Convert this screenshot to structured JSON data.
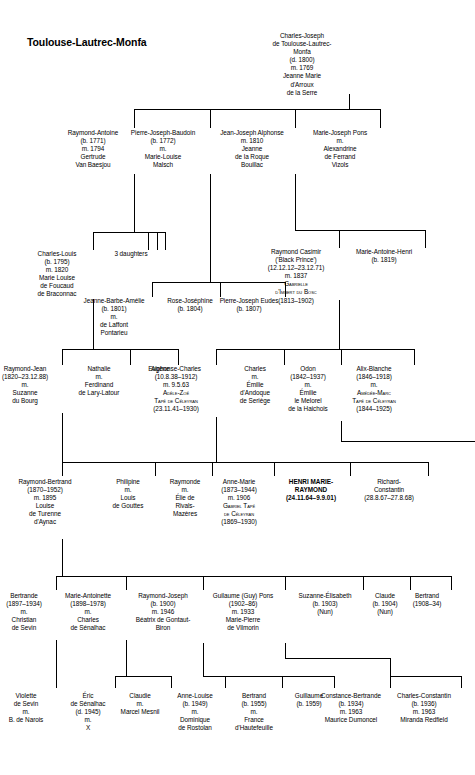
{
  "title": "Toulouse-Lautrec-Monfa",
  "chart_data": {
    "type": "diagram",
    "diagram_kind": "genealogy-family-tree",
    "generations": 7
  },
  "people": [
    {
      "id": "charles-joseph",
      "name": "Charles-Joseph",
      "x": 302,
      "y": 32,
      "w": 94,
      "gen": 1,
      "lines": [
        "Charles-Joseph",
        "de Toulouse-Lautrec-",
        "Monfa",
        "(d. 1800)",
        "m. 1769",
        "Jeanne Marie",
        "d'Arroux",
        "de la Serre"
      ]
    },
    {
      "id": "raymond-antoine",
      "name": "Raymond-Antoine",
      "x": 93,
      "y": 129,
      "w": 82,
      "gen": 2,
      "lines": [
        "Raymond-Antoine",
        "(b. 1771)",
        "m. 1794",
        "Gertrude",
        "Van Baesjou"
      ]
    },
    {
      "id": "pierre-joseph-baudoin",
      "name": "Pierre-Joseph-Baudoin",
      "x": 163,
      "y": 129,
      "w": 94,
      "gen": 2,
      "lines": [
        "Pierre-Joseph-Baudoin",
        "(b. 1772)",
        "m.",
        "Marie-Louise",
        "Malsch"
      ]
    },
    {
      "id": "jean-joseph-alphonse",
      "name": "Jean-Joseph Alphonse",
      "x": 252,
      "y": 129,
      "w": 86,
      "gen": 2,
      "lines": [
        "Jean-Joseph Alphonse",
        "m. 1810",
        "Jeanne",
        "de la Roque",
        "Bouillac"
      ]
    },
    {
      "id": "marie-joseph-pons",
      "name": "Marie-Joseph Pons",
      "x": 340,
      "y": 129,
      "w": 80,
      "gen": 2,
      "lines": [
        "Marie-Joseph Pons",
        "m.",
        "Alexandrine",
        "de Ferrand",
        "Vizols"
      ]
    },
    {
      "id": "charles-louis",
      "name": "Charles-Louis",
      "x": 57,
      "y": 250,
      "w": 72,
      "gen": 3,
      "lines": [
        "Charles-Louis",
        "(b. 1795)",
        "m. 1820",
        "Marie Louise",
        "de Foucaud",
        "de Braconnac"
      ]
    },
    {
      "id": "three-daughters",
      "name": "3 daughters",
      "x": 131,
      "y": 250,
      "w": 52,
      "gen": 3,
      "lines": [
        "3 daughters"
      ]
    },
    {
      "id": "raymond-casimir",
      "name": "Raymond Casimir",
      "x": 296,
      "y": 248,
      "w": 86,
      "gen": 3,
      "lines": [
        "Raymond Casimir",
        "('Black Prince')",
        "(12.12.12–23.12.71)",
        "m. 1837",
        "{sc}Gabrielle",
        "{sc}d'Imbert du Bosc",
        "(1813–1902)"
      ]
    },
    {
      "id": "marie-antoine-henri",
      "name": "Marie-Antoine-Henri",
      "x": 384,
      "y": 248,
      "w": 82,
      "gen": 3,
      "lines": [
        "Marie-Antoine-Henri",
        "(b. 1819)"
      ]
    },
    {
      "id": "jeanne-barbe-amelie",
      "name": "Jeanne-Barbe-Amelie",
      "x": 114,
      "y": 297,
      "w": 76,
      "gen": 3.5,
      "lines": [
        "Jeanne-Barbe-Amélie",
        "(b. 1801)",
        "m.",
        "de Laffont",
        "Pontarieu"
      ]
    },
    {
      "id": "rose-josephine",
      "name": "Rose-Josephine",
      "x": 190,
      "y": 297,
      "w": 60,
      "gen": 3.5,
      "lines": [
        "Rose-Joséphine",
        "(b. 1804)"
      ]
    },
    {
      "id": "pierre-joseph-eudes",
      "name": "Pierre-Joseph Eudes",
      "x": 249,
      "y": 297,
      "w": 72,
      "gen": 3.5,
      "lines": [
        "Pierre-Joseph Eudes",
        "(b. 1807)"
      ]
    },
    {
      "id": "raymond-jean",
      "name": "Raymond-Jean",
      "x": 25,
      "y": 365,
      "w": 74,
      "gen": 4,
      "lines": [
        "Raymond-Jean",
        "(1820–23.12.88)",
        "m.",
        "Suzanne",
        "du Bourg"
      ]
    },
    {
      "id": "nathalie",
      "name": "Nathalie",
      "x": 99,
      "y": 365,
      "w": 62,
      "gen": 4,
      "lines": [
        "Nathalie",
        "m.",
        "Ferdinand",
        "de Lary-Latour"
      ]
    },
    {
      "id": "eugene",
      "name": "Eugene",
      "x": 159,
      "y": 365,
      "w": 38,
      "gen": 4,
      "lines": [
        "Eugène"
      ]
    },
    {
      "id": "alphonse-charles",
      "name": "Alphonse-Charles",
      "x": 176,
      "y": 365,
      "w": 80,
      "gen": 4,
      "lines": [
        "Alphonse-Charles",
        "(10.8.38–1912)",
        "m. 9.5.63",
        "{sc}Adèle-Zoé",
        "{sc}Tapé de Céleyran",
        "(23.11.41–1930)"
      ]
    },
    {
      "id": "charles",
      "name": "Charles",
      "x": 255,
      "y": 365,
      "w": 58,
      "gen": 4,
      "lines": [
        "Charles",
        "m.",
        "Émilie",
        "d'Andoque",
        "de Seriège"
      ]
    },
    {
      "id": "odon",
      "name": "Odon",
      "x": 308,
      "y": 365,
      "w": 66,
      "gen": 4,
      "lines": [
        "Odon",
        "(1842–1937)",
        "m.",
        "Émilie",
        "le Melorel",
        "de la Haichois"
      ]
    },
    {
      "id": "alix-blanche",
      "name": "Alix-Blanche",
      "x": 374,
      "y": 365,
      "w": 80,
      "gen": 4,
      "lines": [
        "Alix-Blanche",
        "(1846–1918)",
        "m.",
        "{sc}Amédée-Marc",
        "{sc}Tapé de Céleyran",
        "(1844–1925)"
      ]
    },
    {
      "id": "raymond-bertrand",
      "name": "Raymond-Bertrand",
      "x": 45,
      "y": 478,
      "w": 84,
      "gen": 5,
      "lines": [
        "Raymond-Bertrand",
        "(1870–1952)",
        "m. 1895",
        "Louise",
        "de Turenne",
        "d'Aynac"
      ]
    },
    {
      "id": "philipine",
      "name": "Philipine",
      "x": 128,
      "y": 478,
      "w": 56,
      "gen": 5,
      "lines": [
        "Philipine",
        "m.",
        "Louis",
        "de Gouttes"
      ]
    },
    {
      "id": "raymonde",
      "name": "Raymonde",
      "x": 185,
      "y": 478,
      "w": 54,
      "gen": 5,
      "lines": [
        "Raymonde",
        "m.",
        "Élie de",
        "Rivals-",
        "Mazères"
      ]
    },
    {
      "id": "anne-marie",
      "name": "Anne-Marie",
      "x": 239,
      "y": 478,
      "w": 72,
      "gen": 5,
      "lines": [
        "Anne-Marie",
        "(1873–1944)",
        "m. 1906",
        "{sc}Gabriel Tapé",
        "{sc}de Céleyran",
        "(1869–1930)"
      ]
    },
    {
      "id": "henri-marie-raymond",
      "name": "HENRI MARIE-RAYMOND",
      "x": 311,
      "y": 478,
      "w": 78,
      "gen": 5,
      "highlight": true,
      "lines": [
        "HENRI MARIE-",
        "RAYMOND",
        "(24.11.64–9.9.01)"
      ]
    },
    {
      "id": "richard-constantin",
      "name": "Richard-Constantin",
      "x": 389,
      "y": 478,
      "w": 76,
      "gen": 5,
      "lines": [
        "Richard-",
        "Constantin",
        "(28.8.67–27.8.68)"
      ]
    },
    {
      "id": "bertrande",
      "name": "Bertrande",
      "x": 24,
      "y": 592,
      "w": 64,
      "gen": 6,
      "lines": [
        "Bertrande",
        "(1897–1934)",
        "m.",
        "Christian",
        "de Sevin"
      ]
    },
    {
      "id": "marie-antoinette",
      "name": "Marie-Antoinette",
      "x": 88,
      "y": 592,
      "w": 76,
      "gen": 6,
      "lines": [
        "Marie-Antoinette",
        "(1898–1978)",
        "m.",
        "Charles",
        "de Sénalhac"
      ]
    },
    {
      "id": "raymond-joseph",
      "name": "Raymond-Joseph",
      "x": 163,
      "y": 592,
      "w": 80,
      "gen": 6,
      "lines": [
        "Raymond-Joseph",
        "(b. 1900)",
        "m. 1946",
        "Béatrix de Gontaut-",
        "Biron"
      ]
    },
    {
      "id": "guilaume-guy-pons",
      "name": "Guilaume (Guy) Pons",
      "x": 243,
      "y": 592,
      "w": 84,
      "gen": 6,
      "lines": [
        "Guilaume (Guy) Pons",
        "(1902–86)",
        "m. 1933",
        "Marie-Pierre",
        "de Vilmorin"
      ]
    },
    {
      "id": "suzanne-elisabeth",
      "name": "Suzanne-Elisabeth",
      "x": 325,
      "y": 592,
      "w": 76,
      "gen": 6,
      "lines": [
        "Suzanne-Élisabeth",
        "(b. 1903)",
        "(Nun)"
      ]
    },
    {
      "id": "claude",
      "name": "Claude",
      "x": 385,
      "y": 592,
      "w": 50,
      "gen": 6,
      "lines": [
        "Claude",
        "(b. 1904)",
        "(Nun)"
      ]
    },
    {
      "id": "bertrand-1908",
      "name": "Bertrand",
      "x": 427,
      "y": 592,
      "w": 48,
      "gen": 6,
      "lines": [
        "Bertrand",
        "(1908–34)"
      ]
    },
    {
      "id": "violette-de-sevin",
      "name": "Violette de Sevin",
      "x": 26,
      "y": 692,
      "w": 62,
      "gen": 7,
      "lines": [
        "Violette",
        "de Sevin",
        "m.",
        "B. de Narois"
      ]
    },
    {
      "id": "eric-de-senalhac",
      "name": "Eric de Senalhac",
      "x": 88,
      "y": 692,
      "w": 56,
      "gen": 7,
      "lines": [
        "Éric",
        "de Sénalhac",
        "(d. 1945)",
        "m.",
        "X"
      ]
    },
    {
      "id": "claudie",
      "name": "Claudie",
      "x": 140,
      "y": 692,
      "w": 62,
      "gen": 7,
      "lines": [
        "Claudie",
        "m.",
        "Marcel Mesnil"
      ]
    },
    {
      "id": "anne-louise",
      "name": "Anne-Louise",
      "x": 195,
      "y": 692,
      "w": 62,
      "gen": 7,
      "lines": [
        "Anne-Louise",
        "(b. 1949)",
        "m.",
        "Dominique",
        "de Rostolan"
      ]
    },
    {
      "id": "bertrand-1955",
      "name": "Bertrand",
      "x": 254,
      "y": 692,
      "w": 58,
      "gen": 7,
      "lines": [
        "Bertrand",
        "(b. 1955)",
        "m.",
        "France",
        "d'Hautefeuille"
      ]
    },
    {
      "id": "guillaume-1959",
      "name": "Guillaume",
      "x": 309,
      "y": 692,
      "w": 48,
      "gen": 7,
      "lines": [
        "Guillaume",
        "(b. 1959)"
      ]
    },
    {
      "id": "constance-bertrande",
      "name": "Constance-Bertrande",
      "x": 351,
      "y": 692,
      "w": 78,
      "gen": 7,
      "lines": [
        "Constance-Bertrande",
        "(b. 1934)",
        "m. 1963",
        "Maurice Dumoncel"
      ]
    },
    {
      "id": "charles-constantin",
      "name": "Charles-Constantin",
      "x": 424,
      "y": 692,
      "w": 74,
      "gen": 7,
      "lines": [
        "Charles-Constantin",
        "(b. 1936)",
        "m. 1963",
        "Miranda Redfield"
      ]
    }
  ],
  "connectors": [
    {
      "name": "root-stem-down",
      "type": "v",
      "x": 349,
      "y": 94,
      "len": 15
    },
    {
      "name": "gen2-sibling-bar",
      "type": "h",
      "x": 134,
      "y": 109,
      "len": 246
    },
    {
      "name": "stem-raymond-antoine",
      "type": "v",
      "x": 134,
      "y": 109,
      "len": 19
    },
    {
      "name": "stem-pierre-joseph-baudoin",
      "type": "v",
      "x": 210,
      "y": 109,
      "len": 19
    },
    {
      "name": "stem-jean-joseph-alphonse",
      "type": "v",
      "x": 295,
      "y": 109,
      "len": 19
    },
    {
      "name": "stem-marie-joseph-pons",
      "type": "v",
      "x": 380,
      "y": 109,
      "len": 19
    },
    {
      "name": "drop-raymond-antoine",
      "type": "v",
      "x": 134,
      "y": 174,
      "len": 58
    },
    {
      "name": "gen3-left-bar",
      "type": "h",
      "x": 93,
      "y": 232,
      "len": 72
    },
    {
      "name": "stem-charles-louis",
      "type": "v",
      "x": 93,
      "y": 232,
      "len": 18
    },
    {
      "name": "stem-3daughters-a",
      "type": "v",
      "x": 148,
      "y": 232,
      "len": 18
    },
    {
      "name": "stem-3daughters-b",
      "type": "v",
      "x": 157,
      "y": 232,
      "len": 18
    },
    {
      "name": "stem-3daughters-c",
      "type": "v",
      "x": 165,
      "y": 232,
      "len": 18
    },
    {
      "name": "drop-pierre-joseph-baudoin",
      "type": "v",
      "x": 210,
      "y": 174,
      "len": 108
    },
    {
      "name": "gen3b-bar",
      "type": "h",
      "x": 152,
      "y": 282,
      "len": 133
    },
    {
      "name": "stem-jeanne-barbe",
      "type": "v",
      "x": 152,
      "y": 282,
      "len": 15
    },
    {
      "name": "stem-rose-josephine",
      "type": "v",
      "x": 220,
      "y": 282,
      "len": 15
    },
    {
      "name": "stem-pierre-joseph-eudes",
      "type": "v",
      "x": 285,
      "y": 282,
      "len": 15
    },
    {
      "name": "drop-jean-joseph-alphonse",
      "type": "v",
      "x": 295,
      "y": 174,
      "len": 56
    },
    {
      "name": "gen3-right-bar",
      "type": "h",
      "x": 339,
      "y": 230,
      "len": 86
    },
    {
      "name": "drop-to-gen3-right-bar",
      "type": "v",
      "x": 339,
      "y": 230,
      "len": 18
    },
    {
      "name": "stem-marie-antoine-henri",
      "type": "v",
      "x": 425,
      "y": 230,
      "len": 18
    },
    {
      "name": "link-jja-to-bar",
      "type": "h",
      "x": 295,
      "y": 230,
      "len": 45
    },
    {
      "name": "drop-charles-louis",
      "type": "v",
      "x": 93,
      "y": 299,
      "len": 50
    },
    {
      "name": "gen4-left-bar",
      "type": "h",
      "x": 62,
      "y": 349,
      "len": 116
    },
    {
      "name": "stem-raymond-jean",
      "type": "v",
      "x": 62,
      "y": 349,
      "len": 16
    },
    {
      "name": "stem-nathalie",
      "type": "v",
      "x": 130,
      "y": 349,
      "len": 16
    },
    {
      "name": "stem-eugene",
      "type": "v",
      "x": 178,
      "y": 349,
      "len": 16
    },
    {
      "name": "drop-raymond-casimir",
      "type": "v",
      "x": 339,
      "y": 300,
      "len": 49
    },
    {
      "name": "gen4-right-bar",
      "type": "h",
      "x": 216,
      "y": 349,
      "len": 198
    },
    {
      "name": "stem-alphonse-charles",
      "type": "v",
      "x": 216,
      "y": 349,
      "len": 16
    },
    {
      "name": "stem-charles",
      "type": "v",
      "x": 284,
      "y": 349,
      "len": 16
    },
    {
      "name": "stem-odon",
      "type": "v",
      "x": 341,
      "y": 349,
      "len": 16
    },
    {
      "name": "stem-alix-blanche",
      "type": "v",
      "x": 414,
      "y": 349,
      "len": 16
    },
    {
      "name": "drop-raymond-jean",
      "type": "v",
      "x": 62,
      "y": 413,
      "len": 49
    },
    {
      "name": "drop-alphonse-charles",
      "type": "v",
      "x": 216,
      "y": 417,
      "len": 45
    },
    {
      "name": "drop-odon",
      "type": "v",
      "x": 341,
      "y": 421,
      "len": 20
    },
    {
      "name": "odon-route-right",
      "type": "h",
      "x": 341,
      "y": 441,
      "len": 134
    },
    {
      "name": "gen5-left-bar",
      "type": "h",
      "x": 62,
      "y": 462,
      "len": 212
    },
    {
      "name": "ac-elbow-down",
      "type": "v",
      "x": 216,
      "y": 462,
      "len": 0
    },
    {
      "name": "gen5-left-to-right-join",
      "type": "h",
      "x": 216,
      "y": 462,
      "len": 134
    },
    {
      "name": "gen5-right-bar",
      "type": "h",
      "x": 350,
      "y": 462,
      "len": 78
    },
    {
      "name": "stem-raymond-bertrand",
      "type": "v",
      "x": 62,
      "y": 462,
      "len": 14
    },
    {
      "name": "stem-philipine",
      "type": "v",
      "x": 155,
      "y": 462,
      "len": 14
    },
    {
      "name": "stem-raymonde",
      "type": "v",
      "x": 212,
      "y": 462,
      "len": 14
    },
    {
      "name": "stem-anne-marie",
      "type": "v",
      "x": 274,
      "y": 462,
      "len": 14
    },
    {
      "name": "stem-henri",
      "type": "v",
      "x": 350,
      "y": 462,
      "len": 14
    },
    {
      "name": "stem-richard",
      "type": "v",
      "x": 428,
      "y": 462,
      "len": 14
    },
    {
      "name": "drop-raymond-bertrand",
      "type": "v",
      "x": 62,
      "y": 539,
      "len": 37
    },
    {
      "name": "gen6-bar",
      "type": "h",
      "x": 56,
      "y": 576,
      "len": 395
    },
    {
      "name": "stem-bertrande",
      "type": "v",
      "x": 56,
      "y": 576,
      "len": 14
    },
    {
      "name": "stem-marie-antoinette",
      "type": "v",
      "x": 126,
      "y": 576,
      "len": 14
    },
    {
      "name": "stem-raymond-joseph",
      "type": "v",
      "x": 203,
      "y": 576,
      "len": 14
    },
    {
      "name": "stem-guilaume",
      "type": "v",
      "x": 285,
      "y": 576,
      "len": 14
    },
    {
      "name": "stem-suzanne",
      "type": "v",
      "x": 363,
      "y": 576,
      "len": 14
    },
    {
      "name": "stem-claude",
      "type": "v",
      "x": 410,
      "y": 576,
      "len": 14
    },
    {
      "name": "stem-bertrand-1908",
      "type": "v",
      "x": 451,
      "y": 576,
      "len": 14
    },
    {
      "name": "drop-bertrande",
      "type": "v",
      "x": 56,
      "y": 640,
      "len": 36
    },
    {
      "name": "stem-violette",
      "type": "v",
      "x": 56,
      "y": 676,
      "len": 12
    },
    {
      "name": "drop-marie-antoinette",
      "type": "v",
      "x": 126,
      "y": 640,
      "len": 36
    },
    {
      "name": "gen7-senalhac-bar",
      "type": "h",
      "x": 115,
      "y": 676,
      "len": 56
    },
    {
      "name": "stem-eric",
      "type": "v",
      "x": 115,
      "y": 676,
      "len": 12
    },
    {
      "name": "stem-claudie",
      "type": "v",
      "x": 171,
      "y": 676,
      "len": 12
    },
    {
      "name": "drop-raymond-joseph",
      "type": "v",
      "x": 203,
      "y": 643,
      "len": 33
    },
    {
      "name": "gen7-rj-bar",
      "type": "h",
      "x": 225,
      "y": 676,
      "len": 109
    },
    {
      "name": "rj-connect",
      "type": "h",
      "x": 203,
      "y": 676,
      "len": 23
    },
    {
      "name": "stem-anne-louise",
      "type": "v",
      "x": 225,
      "y": 676,
      "len": 12
    },
    {
      "name": "stem-bertrand-1955",
      "type": "v",
      "x": 282,
      "y": 676,
      "len": 12
    },
    {
      "name": "stem-guillaume-1959",
      "type": "v",
      "x": 334,
      "y": 676,
      "len": 12
    },
    {
      "name": "drop-guilaume-guy",
      "type": "v",
      "x": 285,
      "y": 643,
      "len": 15
    },
    {
      "name": "guy-route-right",
      "type": "h",
      "x": 285,
      "y": 658,
      "len": 105
    },
    {
      "name": "guy-route-down",
      "type": "v",
      "x": 390,
      "y": 658,
      "len": 18
    },
    {
      "name": "gen7-guy-bar",
      "type": "h",
      "x": 390,
      "y": 676,
      "len": 71
    },
    {
      "name": "stem-constance",
      "type": "v",
      "x": 390,
      "y": 676,
      "len": 12
    },
    {
      "name": "stem-charles-constantin",
      "type": "v",
      "x": 461,
      "y": 676,
      "len": 12
    }
  ]
}
